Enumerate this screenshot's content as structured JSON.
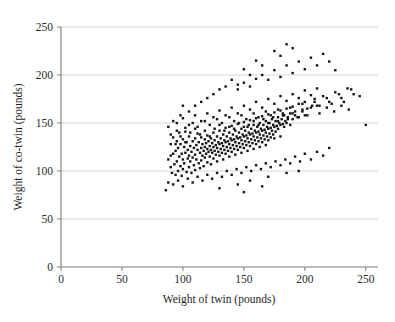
{
  "chart_data": {
    "type": "scatter",
    "title": "",
    "xlabel": "Weight of twin (pounds)",
    "ylabel": "Weight of co-twin (pounds)",
    "xlim": [
      0,
      260
    ],
    "ylim": [
      0,
      250
    ],
    "xticks": [
      0,
      50,
      100,
      150,
      200,
      250
    ],
    "yticks": [
      0,
      50,
      100,
      150,
      200,
      250
    ],
    "xtick_labels": [
      "0",
      "50",
      "100",
      "150",
      "200",
      "250"
    ],
    "ytick_labels": [
      "0",
      "50",
      "100",
      "150",
      "200",
      "250"
    ],
    "grid": "horizontal",
    "legend": "none",
    "marker": "square",
    "marker_size_px": 2.4,
    "marker_color": "#151515",
    "gridline_color": "#d2d2d2",
    "axis_color": "#7a7a7a",
    "background_color": "#ffffff",
    "n_points": 420,
    "points": [
      [
        88,
        112
      ],
      [
        90,
        104
      ],
      [
        90,
        128
      ],
      [
        91,
        98
      ],
      [
        92,
        118
      ],
      [
        92,
        135
      ],
      [
        93,
        107
      ],
      [
        94,
        121
      ],
      [
        94,
        96
      ],
      [
        95,
        131
      ],
      [
        95,
        110
      ],
      [
        96,
        100
      ],
      [
        96,
        124
      ],
      [
        97,
        115
      ],
      [
        97,
        140
      ],
      [
        98,
        105
      ],
      [
        98,
        128
      ],
      [
        99,
        118
      ],
      [
        99,
        95
      ],
      [
        100,
        133
      ],
      [
        100,
        112
      ],
      [
        100,
        102
      ],
      [
        101,
        125
      ],
      [
        101,
        108
      ],
      [
        102,
        119
      ],
      [
        102,
        141
      ],
      [
        103,
        99
      ],
      [
        103,
        130
      ],
      [
        104,
        113
      ],
      [
        104,
        122
      ],
      [
        105,
        104
      ],
      [
        105,
        136
      ],
      [
        105,
        116
      ],
      [
        106,
        126
      ],
      [
        106,
        110
      ],
      [
        107,
        120
      ],
      [
        107,
        98
      ],
      [
        108,
        131
      ],
      [
        108,
        114
      ],
      [
        109,
        124
      ],
      [
        109,
        106
      ],
      [
        110,
        134
      ],
      [
        110,
        117
      ],
      [
        110,
        101
      ],
      [
        111,
        127
      ],
      [
        111,
        112
      ],
      [
        112,
        122
      ],
      [
        112,
        139
      ],
      [
        113,
        108
      ],
      [
        113,
        130
      ],
      [
        114,
        119
      ],
      [
        114,
        103
      ],
      [
        115,
        135
      ],
      [
        115,
        124
      ],
      [
        115,
        111
      ],
      [
        116,
        128
      ],
      [
        116,
        116
      ],
      [
        117,
        121
      ],
      [
        117,
        105
      ],
      [
        118,
        133
      ],
      [
        118,
        125
      ],
      [
        118,
        114
      ],
      [
        119,
        129
      ],
      [
        119,
        118
      ],
      [
        120,
        137
      ],
      [
        120,
        123
      ],
      [
        120,
        109
      ],
      [
        121,
        131
      ],
      [
        121,
        120
      ],
      [
        122,
        126
      ],
      [
        122,
        115
      ],
      [
        123,
        134
      ],
      [
        123,
        122
      ],
      [
        123,
        107
      ],
      [
        124,
        129
      ],
      [
        124,
        119
      ],
      [
        125,
        140
      ],
      [
        125,
        125
      ],
      [
        125,
        113
      ],
      [
        126,
        132
      ],
      [
        126,
        121
      ],
      [
        127,
        127
      ],
      [
        127,
        117
      ],
      [
        128,
        136
      ],
      [
        128,
        124
      ],
      [
        128,
        110
      ],
      [
        129,
        130
      ],
      [
        129,
        120
      ],
      [
        130,
        142
      ],
      [
        130,
        128
      ],
      [
        130,
        116
      ],
      [
        131,
        134
      ],
      [
        131,
        123
      ],
      [
        132,
        129
      ],
      [
        132,
        119
      ],
      [
        133,
        138
      ],
      [
        133,
        126
      ],
      [
        133,
        112
      ],
      [
        134,
        132
      ],
      [
        134,
        122
      ],
      [
        135,
        145
      ],
      [
        135,
        130
      ],
      [
        135,
        118
      ],
      [
        136,
        136
      ],
      [
        136,
        125
      ],
      [
        137,
        131
      ],
      [
        137,
        121
      ],
      [
        138,
        140
      ],
      [
        138,
        128
      ],
      [
        138,
        115
      ],
      [
        139,
        134
      ],
      [
        139,
        124
      ],
      [
        140,
        147
      ],
      [
        140,
        132
      ],
      [
        140,
        120
      ],
      [
        141,
        138
      ],
      [
        141,
        127
      ],
      [
        142,
        133
      ],
      [
        142,
        123
      ],
      [
        143,
        142
      ],
      [
        143,
        130
      ],
      [
        143,
        117
      ],
      [
        144,
        136
      ],
      [
        144,
        126
      ],
      [
        145,
        149
      ],
      [
        145,
        134
      ],
      [
        145,
        122
      ],
      [
        146,
        140
      ],
      [
        146,
        129
      ],
      [
        147,
        135
      ],
      [
        147,
        125
      ],
      [
        148,
        144
      ],
      [
        148,
        132
      ],
      [
        148,
        119
      ],
      [
        149,
        138
      ],
      [
        149,
        128
      ],
      [
        150,
        151
      ],
      [
        150,
        136
      ],
      [
        150,
        124
      ],
      [
        151,
        142
      ],
      [
        151,
        131
      ],
      [
        152,
        137
      ],
      [
        152,
        127
      ],
      [
        153,
        146
      ],
      [
        153,
        134
      ],
      [
        153,
        121
      ],
      [
        154,
        140
      ],
      [
        154,
        130
      ],
      [
        155,
        153
      ],
      [
        155,
        138
      ],
      [
        155,
        126
      ],
      [
        156,
        144
      ],
      [
        156,
        133
      ],
      [
        157,
        139
      ],
      [
        157,
        129
      ],
      [
        158,
        148
      ],
      [
        158,
        136
      ],
      [
        158,
        123
      ],
      [
        159,
        142
      ],
      [
        159,
        132
      ],
      [
        160,
        155
      ],
      [
        160,
        140
      ],
      [
        160,
        128
      ],
      [
        161,
        146
      ],
      [
        161,
        135
      ],
      [
        162,
        141
      ],
      [
        162,
        131
      ],
      [
        163,
        150
      ],
      [
        163,
        138
      ],
      [
        163,
        125
      ],
      [
        164,
        144
      ],
      [
        164,
        134
      ],
      [
        165,
        157
      ],
      [
        165,
        142
      ],
      [
        165,
        130
      ],
      [
        166,
        148
      ],
      [
        166,
        137
      ],
      [
        167,
        143
      ],
      [
        167,
        133
      ],
      [
        168,
        152
      ],
      [
        168,
        140
      ],
      [
        168,
        127
      ],
      [
        169,
        146
      ],
      [
        169,
        136
      ],
      [
        170,
        159
      ],
      [
        170,
        144
      ],
      [
        170,
        132
      ],
      [
        171,
        150
      ],
      [
        171,
        139
      ],
      [
        172,
        145
      ],
      [
        172,
        135
      ],
      [
        173,
        154
      ],
      [
        173,
        142
      ],
      [
        174,
        148
      ],
      [
        174,
        138
      ],
      [
        175,
        161
      ],
      [
        175,
        146
      ],
      [
        175,
        134
      ],
      [
        176,
        152
      ],
      [
        176,
        141
      ],
      [
        177,
        147
      ],
      [
        178,
        156
      ],
      [
        178,
        144
      ],
      [
        179,
        150
      ],
      [
        180,
        163
      ],
      [
        180,
        148
      ],
      [
        180,
        136
      ],
      [
        181,
        154
      ],
      [
        182,
        149
      ],
      [
        183,
        158
      ],
      [
        183,
        146
      ],
      [
        184,
        152
      ],
      [
        185,
        165
      ],
      [
        185,
        150
      ],
      [
        186,
        156
      ],
      [
        188,
        160
      ],
      [
        188,
        148
      ],
      [
        190,
        167
      ],
      [
        190,
        154
      ],
      [
        192,
        158
      ],
      [
        195,
        170
      ],
      [
        195,
        156
      ],
      [
        198,
        162
      ],
      [
        200,
        172
      ],
      [
        200,
        158
      ],
      [
        205,
        166
      ],
      [
        208,
        175
      ],
      [
        210,
        168
      ],
      [
        215,
        178
      ],
      [
        220,
        172
      ],
      [
        225,
        182
      ],
      [
        230,
        176
      ],
      [
        235,
        186
      ],
      [
        240,
        180
      ],
      [
        250,
        148
      ],
      [
        95,
        150
      ],
      [
        100,
        155
      ],
      [
        105,
        148
      ],
      [
        110,
        158
      ],
      [
        115,
        152
      ],
      [
        120,
        160
      ],
      [
        125,
        156
      ],
      [
        130,
        163
      ],
      [
        135,
        158
      ],
      [
        140,
        166
      ],
      [
        145,
        160
      ],
      [
        150,
        168
      ],
      [
        155,
        164
      ],
      [
        160,
        172
      ],
      [
        165,
        166
      ],
      [
        170,
        175
      ],
      [
        175,
        170
      ],
      [
        180,
        178
      ],
      [
        185,
        173
      ],
      [
        190,
        180
      ],
      [
        195,
        176
      ],
      [
        200,
        184
      ],
      [
        205,
        179
      ],
      [
        210,
        186
      ],
      [
        150,
        192
      ],
      [
        160,
        196
      ],
      [
        155,
        188
      ],
      [
        145,
        185
      ],
      [
        165,
        200
      ],
      [
        170,
        195
      ],
      [
        175,
        205
      ],
      [
        180,
        198
      ],
      [
        185,
        210
      ],
      [
        190,
        202
      ],
      [
        195,
        214
      ],
      [
        200,
        206
      ],
      [
        205,
        218
      ],
      [
        210,
        210
      ],
      [
        215,
        222
      ],
      [
        220,
        214
      ],
      [
        225,
        205
      ],
      [
        185,
        232
      ],
      [
        190,
        228
      ],
      [
        175,
        225
      ],
      [
        180,
        220
      ],
      [
        160,
        215
      ],
      [
        165,
        210
      ],
      [
        150,
        206
      ],
      [
        155,
        200
      ],
      [
        140,
        195
      ],
      [
        145,
        190
      ],
      [
        135,
        188
      ],
      [
        130,
        185
      ],
      [
        125,
        180
      ],
      [
        120,
        176
      ],
      [
        115,
        172
      ],
      [
        110,
        168
      ],
      [
        105,
        162
      ],
      [
        100,
        168
      ],
      [
        95,
        142
      ],
      [
        90,
        138
      ],
      [
        88,
        146
      ],
      [
        92,
        152
      ],
      [
        98,
        158
      ],
      [
        102,
        145
      ],
      [
        108,
        150
      ],
      [
        112,
        146
      ],
      [
        118,
        152
      ],
      [
        122,
        148
      ],
      [
        128,
        154
      ],
      [
        132,
        150
      ],
      [
        138,
        156
      ],
      [
        142,
        152
      ],
      [
        148,
        158
      ],
      [
        152,
        154
      ],
      [
        158,
        160
      ],
      [
        162,
        156
      ],
      [
        168,
        162
      ],
      [
        172,
        158
      ],
      [
        178,
        164
      ],
      [
        182,
        160
      ],
      [
        188,
        166
      ],
      [
        192,
        162
      ],
      [
        198,
        170
      ],
      [
        202,
        165
      ],
      [
        208,
        172
      ],
      [
        212,
        168
      ],
      [
        218,
        176
      ],
      [
        222,
        170
      ],
      [
        228,
        180
      ],
      [
        232,
        172
      ],
      [
        238,
        185
      ],
      [
        245,
        178
      ],
      [
        88,
        88
      ],
      [
        92,
        86
      ],
      [
        96,
        90
      ],
      [
        100,
        84
      ],
      [
        104,
        92
      ],
      [
        108,
        88
      ],
      [
        112,
        94
      ],
      [
        116,
        90
      ],
      [
        120,
        96
      ],
      [
        124,
        92
      ],
      [
        128,
        98
      ],
      [
        132,
        94
      ],
      [
        136,
        100
      ],
      [
        140,
        96
      ],
      [
        144,
        102
      ],
      [
        148,
        98
      ],
      [
        152,
        104
      ],
      [
        156,
        100
      ],
      [
        160,
        106
      ],
      [
        164,
        102
      ],
      [
        168,
        108
      ],
      [
        172,
        104
      ],
      [
        176,
        110
      ],
      [
        180,
        106
      ],
      [
        184,
        112
      ],
      [
        188,
        108
      ],
      [
        192,
        115
      ],
      [
        196,
        110
      ],
      [
        200,
        118
      ],
      [
        205,
        112
      ],
      [
        210,
        120
      ],
      [
        215,
        116
      ],
      [
        220,
        124
      ],
      [
        86,
        80
      ],
      [
        130,
        82
      ],
      [
        145,
        86
      ],
      [
        155,
        90
      ],
      [
        170,
        94
      ],
      [
        185,
        98
      ],
      [
        195,
        100
      ],
      [
        150,
        78
      ],
      [
        165,
        84
      ],
      [
        90,
        116
      ],
      [
        94,
        128
      ],
      [
        98,
        136
      ],
      [
        102,
        130
      ],
      [
        106,
        140
      ],
      [
        110,
        144
      ],
      [
        114,
        138
      ],
      [
        118,
        142
      ],
      [
        122,
        136
      ],
      [
        126,
        144
      ],
      [
        130,
        148
      ],
      [
        134,
        142
      ],
      [
        138,
        146
      ],
      [
        142,
        144
      ],
      [
        146,
        150
      ],
      [
        150,
        146
      ],
      [
        154,
        148
      ],
      [
        158,
        152
      ],
      [
        162,
        148
      ],
      [
        166,
        154
      ],
      [
        170,
        150
      ],
      [
        174,
        156
      ],
      [
        178,
        152
      ],
      [
        182,
        158
      ],
      [
        186,
        154
      ],
      [
        190,
        160
      ],
      [
        194,
        156
      ],
      [
        198,
        164
      ],
      [
        202,
        158
      ],
      [
        206,
        168
      ],
      [
        212,
        160
      ],
      [
        218,
        166
      ],
      [
        224,
        162
      ],
      [
        230,
        168
      ],
      [
        236,
        164
      ]
    ]
  }
}
